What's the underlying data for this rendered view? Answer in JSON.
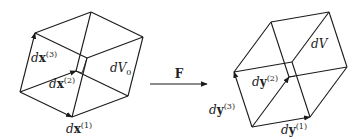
{
  "diagram": {
    "mapping": {
      "label": "F"
    },
    "reference": {
      "volume_label_d": "d",
      "volume_label_V": "V",
      "volume_label_sub": "0",
      "vectors": [
        {
          "d": "d",
          "sym": "x",
          "sup": "(1)"
        },
        {
          "d": "d",
          "sym": "x",
          "sup": "(2)"
        },
        {
          "d": "d",
          "sym": "x",
          "sup": "(3)"
        }
      ]
    },
    "deformed": {
      "volume_label_d": "d",
      "volume_label_V": "V",
      "vectors": [
        {
          "d": "d",
          "sym": "y",
          "sup": "(1)"
        },
        {
          "d": "d",
          "sym": "y",
          "sup": "(2)"
        },
        {
          "d": "d",
          "sym": "y",
          "sup": "(3)"
        }
      ]
    },
    "colors": {
      "stroke": "#1a1a1a",
      "background": "#ffffff"
    }
  }
}
